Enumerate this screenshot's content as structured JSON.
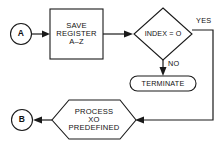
{
  "diagram": {
    "type": "flowchart",
    "title": "",
    "background_color": "#ffffff",
    "line_color": "#1a1a1a",
    "nodes": {
      "connector_a": {
        "shape": "circle",
        "label": "A"
      },
      "save_register": {
        "shape": "rectangle",
        "line1": "SAVE",
        "line2": "REGISTER",
        "line3": "A–Z"
      },
      "index_decision": {
        "shape": "diamond",
        "label": "INDEX = O"
      },
      "terminate": {
        "shape": "terminal",
        "label": "TERMINATE"
      },
      "process_xo": {
        "shape": "hexagon",
        "line1": "PROCESS",
        "line2": "XO",
        "line3": "PREDEFINED"
      },
      "connector_b": {
        "shape": "circle",
        "label": "B"
      }
    },
    "branch_labels": {
      "yes": "YES",
      "no": "NO"
    }
  }
}
